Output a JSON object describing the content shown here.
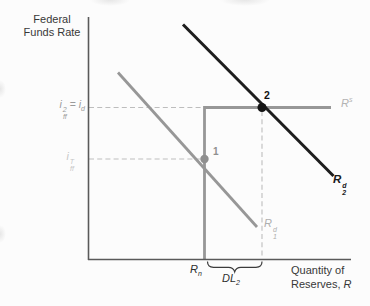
{
  "y_axis": {
    "title_line1": "Federal",
    "title_line2": "Funds Rate"
  },
  "x_axis": {
    "title_line1": "Quantity of",
    "title_line2_prefix": "Reserves, ",
    "title_line2_var": "R"
  },
  "labels": {
    "discount_rate": {
      "base": "i",
      "sup": "2",
      "sub": "ff",
      "eq": "=",
      "rhs_base": "i",
      "rhs_sub": "d"
    },
    "target_rate": {
      "base": "i",
      "sup": "T",
      "sub": "ff"
    },
    "supply": {
      "base": "R",
      "sup": "s"
    },
    "demand2": {
      "base": "R",
      "sup": "d",
      "sub": "2"
    },
    "demand1": {
      "base": "R",
      "sup": "d",
      "sub": "1"
    },
    "nonborrowed_reserves": {
      "base": "R",
      "sub": "n"
    },
    "discount_loans": {
      "base": "DL",
      "sub": "2"
    },
    "point1": "1",
    "point2": "2"
  },
  "colors": {
    "black_curve": "#1d1d1d",
    "gray_curve": "#979797",
    "axis": "#5a5a5a",
    "dashed": "#bdbdbd",
    "dot1": "#8f8f8f",
    "dot2": "#141414",
    "brace": "#3c3c3c"
  },
  "figure": {
    "type": "supply-demand-diagram",
    "curves": [
      {
        "label": "Rs",
        "color": "#979797",
        "shape": "vertical at Rn then horizontal at i2ff = id"
      },
      {
        "label": "Rd1",
        "color": "#979797",
        "shape": "downward-sloping"
      },
      {
        "label": "Rd2",
        "color": "#1d1d1d",
        "shape": "downward-sloping"
      }
    ],
    "points": [
      {
        "label": "1",
        "on": "Rd1 x vertical supply, at target rate iTff"
      },
      {
        "label": "2",
        "on": "Rd2 x horizontal supply, at i2ff = id"
      }
    ],
    "x_marks": [
      "Rn",
      "DL2 span from Rn to quantity at point 2"
    ]
  }
}
